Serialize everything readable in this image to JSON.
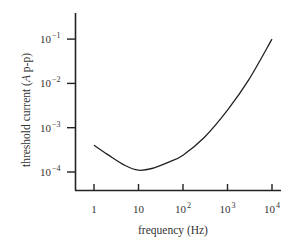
{
  "chart_data": {
    "type": "line",
    "title": "",
    "xlabel": "frequency (Hz)",
    "ylabel_prefix": "threshold current (",
    "ylabel_italic": "A",
    "ylabel_suffix": " p-p)",
    "xscale": "log",
    "yscale": "log",
    "xlim": [
      0.6,
      13000
    ],
    "ylim": [
      7e-05,
      0.3
    ],
    "grid": false,
    "legend": null,
    "x_ticks": [
      {
        "base": "1",
        "exp": "",
        "value": 1
      },
      {
        "base": "10",
        "exp": "",
        "value": 10
      },
      {
        "base": "10",
        "exp": "2",
        "value": 100
      },
      {
        "base": "10",
        "exp": "3",
        "value": 1000
      },
      {
        "base": "10",
        "exp": "4",
        "value": 10000
      }
    ],
    "y_ticks": [
      {
        "base": "10",
        "exp": "-1",
        "value": 0.1
      },
      {
        "base": "10",
        "exp": "-2",
        "value": 0.01
      },
      {
        "base": "10",
        "exp": "-3",
        "value": 0.001
      },
      {
        "base": "10",
        "exp": "-4",
        "value": 0.0001
      }
    ],
    "series": [
      {
        "name": "threshold current",
        "color": "#222222",
        "x": [
          1,
          2,
          5,
          10,
          20,
          50,
          100,
          300,
          1000,
          3000,
          10000
        ],
        "y": [
          0.0004,
          0.00025,
          0.00014,
          0.00011,
          0.00012,
          0.00017,
          0.00024,
          0.0006,
          0.0025,
          0.012,
          0.1
        ]
      }
    ]
  }
}
